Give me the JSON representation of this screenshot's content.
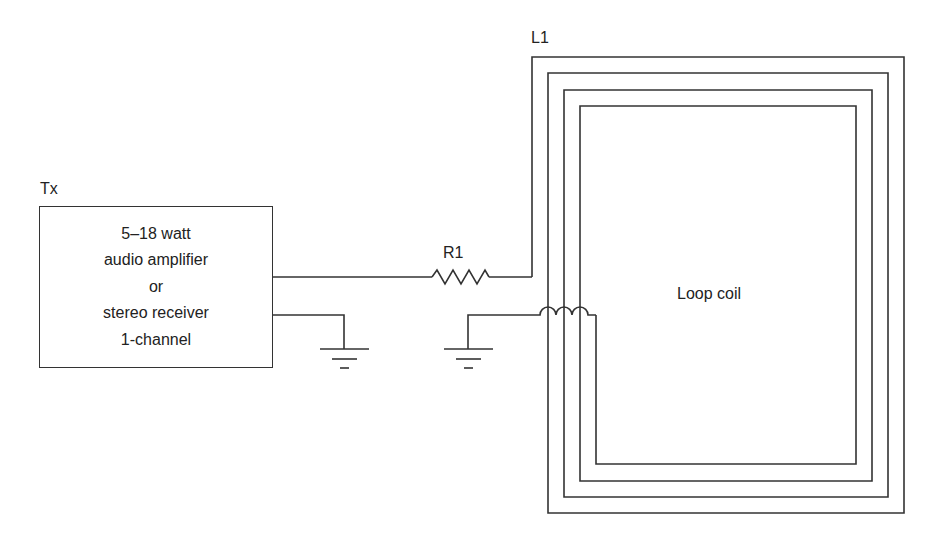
{
  "diagram": {
    "type": "circuit schematic",
    "transmitter": {
      "label": "Tx",
      "lines": [
        "5–18 watt",
        "audio amplifier",
        "or",
        "stereo receiver",
        "1-channel"
      ]
    },
    "resistor": {
      "label": "R1"
    },
    "inductor": {
      "label": "L1"
    },
    "loop": {
      "label": "Loop coil"
    },
    "grounds": 2,
    "colors": {
      "line": "#333333",
      "text": "#222222",
      "background": "#ffffff"
    }
  }
}
